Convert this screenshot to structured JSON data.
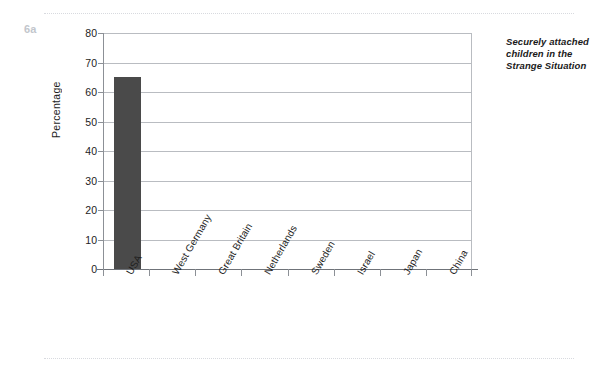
{
  "figure": {
    "label": "6a"
  },
  "caption": {
    "lines": [
      "Securely attached",
      "children in the",
      "Strange Situation"
    ],
    "full_text": "Securely attached children in the Strange Situation"
  },
  "chart_data": {
    "type": "bar",
    "xlabel": "",
    "ylabel": "Percentage",
    "categories": [
      "USA",
      "West Germany",
      "Great Britain",
      "Netherlands",
      "Sweden",
      "Israel",
      "Japan",
      "China"
    ],
    "values": [
      65,
      null,
      null,
      null,
      null,
      null,
      null,
      null
    ],
    "ylim": [
      0,
      80
    ],
    "ytick_labels": [
      "0",
      "10",
      "20",
      "30",
      "40",
      "50",
      "60",
      "70",
      "80"
    ],
    "ytick_values": [
      0,
      10,
      20,
      30,
      40,
      50,
      60,
      70,
      80
    ],
    "grid": true,
    "legend": false,
    "bar_color": "#4a4a4a",
    "gridline_color": "#b9bcc1",
    "axis_color": "#6f7379"
  }
}
